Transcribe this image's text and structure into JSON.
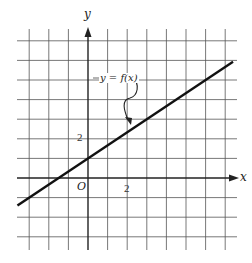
{
  "chart_data": {
    "type": "line",
    "title": "",
    "xlabel": "x",
    "ylabel": "y",
    "origin_label": "O",
    "function_label": "y = f(x)",
    "tick_labels": {
      "x": [
        "2"
      ],
      "y": [
        "2"
      ]
    },
    "grid": true,
    "grid_unit": 1,
    "xlim": [
      -3.7,
      7.7
    ],
    "ylim": [
      -3.5,
      7.2
    ],
    "series": [
      {
        "name": "y = f(x)",
        "equation": "f(x) = (2/3)x + 1",
        "slope": 0.6667,
        "y_intercept": 1,
        "x_intercept": -1.5,
        "x": [
          -3.6,
          0,
          1.5,
          3,
          7.4
        ],
        "y": [
          -1.4,
          1,
          2,
          3,
          5.93
        ]
      }
    ]
  },
  "labels": {
    "x_axis": "x",
    "y_axis": "y",
    "origin": "O",
    "x_tick": "2",
    "y_tick": "2",
    "function": "y = f(x)"
  },
  "colors": {
    "grid": "#555555",
    "axis": "#222222",
    "line": "#111111",
    "background": "#ffffff"
  }
}
